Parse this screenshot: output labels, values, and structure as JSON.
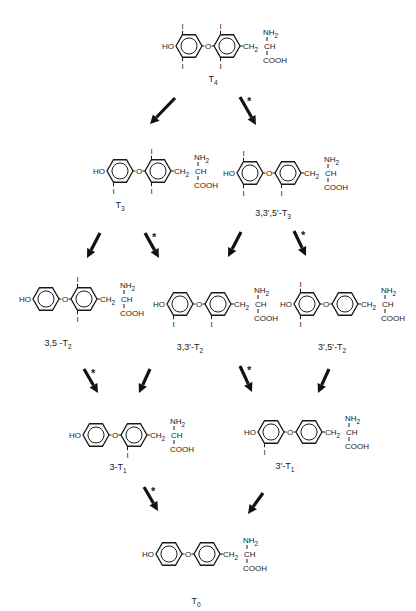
{
  "substituent_labels": {
    "hydroxyl": "HO",
    "oxygen": "O",
    "iodine": "I",
    "ch2": "CH",
    "ch2_sub": "2",
    "ch": "CH",
    "nh2": "NH",
    "nh2_sub": "2",
    "cooh": "COOH"
  },
  "star_symbol": "*",
  "compounds": [
    {
      "id": "T4",
      "name": "T",
      "name_sub": "4",
      "outer_iodines": [
        "3'",
        "5'"
      ],
      "inner_iodines": [
        "3",
        "5"
      ]
    },
    {
      "id": "T3",
      "name": "T",
      "name_sub": "3",
      "outer_iodines": [
        "3'"
      ],
      "inner_iodines": [
        "3",
        "5"
      ]
    },
    {
      "id": "rT3",
      "name": "3,3',5'-T",
      "name_sub": "3",
      "outer_iodines": [
        "3'",
        "5'"
      ],
      "inner_iodines": [
        "3"
      ]
    },
    {
      "id": "35T2",
      "name": "3,5 -T",
      "name_sub": "2",
      "outer_iodines": [],
      "inner_iodines": [
        "3",
        "5"
      ]
    },
    {
      "id": "33T2",
      "name": "3,3'-T",
      "name_sub": "2",
      "outer_iodines": [
        "3'"
      ],
      "inner_iodines": [
        "3"
      ]
    },
    {
      "id": "3p5pT2",
      "name": "3',5'-T",
      "name_sub": "2",
      "outer_iodines": [
        "3'",
        "5'"
      ],
      "inner_iodines": []
    },
    {
      "id": "3T1",
      "name": "3-T",
      "name_sub": "1",
      "outer_iodines": [],
      "inner_iodines": [
        "3"
      ]
    },
    {
      "id": "3pT1",
      "name": "3'-T",
      "name_sub": "1",
      "outer_iodines": [
        "3'"
      ],
      "inner_iodines": []
    },
    {
      "id": "T0",
      "name": "T",
      "name_sub": "0",
      "outer_iodines": [],
      "inner_iodines": []
    }
  ],
  "reactions": [
    {
      "from": "T4",
      "to": "T3",
      "starred": false
    },
    {
      "from": "T4",
      "to": "rT3",
      "starred": true
    },
    {
      "from": "T3",
      "to": "35T2",
      "starred": false
    },
    {
      "from": "T3",
      "to": "33T2",
      "starred": true
    },
    {
      "from": "rT3",
      "to": "33T2",
      "starred": false
    },
    {
      "from": "rT3",
      "to": "3p5pT2",
      "starred": true
    },
    {
      "from": "35T2",
      "to": "3T1",
      "starred": true
    },
    {
      "from": "33T2",
      "to": "3T1",
      "starred": false
    },
    {
      "from": "33T2",
      "to": "3pT1",
      "starred": true
    },
    {
      "from": "3p5pT2",
      "to": "3pT1",
      "starred": false
    },
    {
      "from": "3T1",
      "to": "T0",
      "starred": true
    },
    {
      "from": "3pT1",
      "to": "T0",
      "starred": false
    }
  ]
}
